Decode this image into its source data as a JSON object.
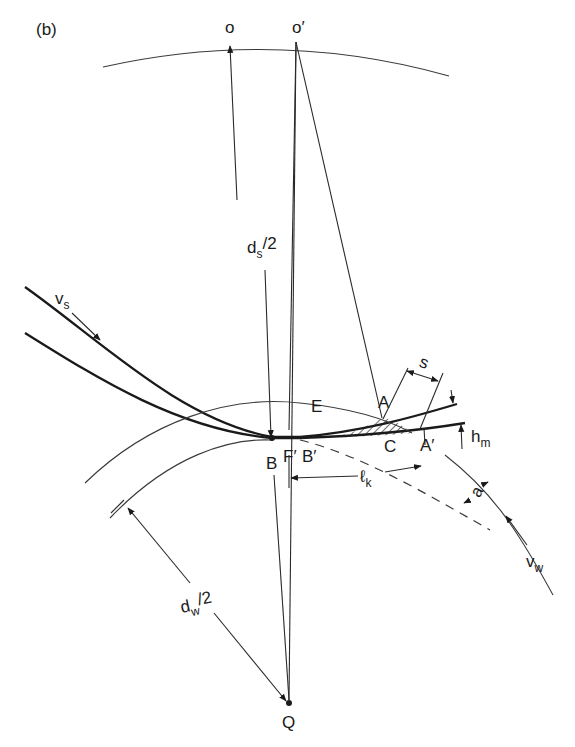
{
  "figure": {
    "panel_label": "(b)",
    "points": {
      "o": "o",
      "o_prime": "o′",
      "E": "E",
      "A": "A",
      "A_prime": "A′",
      "B": "B",
      "B_prime": "B′",
      "F_prime": "F′",
      "C": "C",
      "Q": "Q"
    },
    "dimensions": {
      "ds_half": {
        "main": "d",
        "sub": "s",
        "tail": "/2"
      },
      "dw_half": {
        "main": "d",
        "sub": "w",
        "tail": "/2"
      },
      "lk": {
        "main": "ℓ",
        "sub": "k"
      },
      "s": "s",
      "hm": {
        "main": "h",
        "sub": "m"
      },
      "a": "a"
    },
    "velocities": {
      "vs": {
        "main": "v",
        "sub": "s"
      },
      "vw": {
        "main": "v",
        "sub": "w"
      }
    }
  }
}
